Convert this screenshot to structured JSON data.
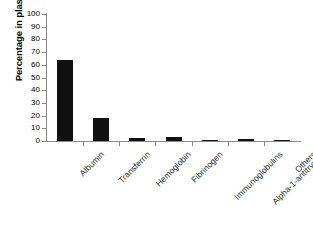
{
  "chart_data": {
    "type": "bar",
    "title": "",
    "xlabel": "",
    "ylabel": "Percentage in plasma",
    "ylim": [
      0,
      100
    ],
    "ytick_step": 10,
    "ytick_labels": [
      "0",
      "10",
      "20",
      "30",
      "40",
      "50",
      "60",
      "70",
      "80",
      "90",
      "100"
    ],
    "grid": false,
    "legend": false,
    "bar_color": "#111111",
    "axis_color": "#8a8a8a",
    "categories": [
      "Albumin",
      "Transferrin",
      "Hemoglobin",
      "Fibrinogen",
      "Immunoglobulins",
      "Alpha-1-antitrypsin",
      "Others"
    ],
    "values": [
      64,
      18,
      2,
      3,
      1,
      1.5,
      1
    ]
  }
}
